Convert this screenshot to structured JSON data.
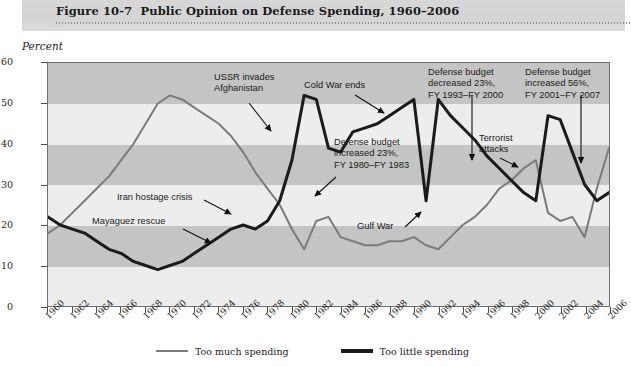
{
  "figure": {
    "number": "Figure 10-7",
    "title": "Public Opinion on Defense Spending, 1960–2006",
    "axis_note": "Percent"
  },
  "legend": {
    "items": [
      {
        "label": "Too much spending",
        "color": "#7b7b7b",
        "key": "too-much"
      },
      {
        "label": "Too little spending",
        "color": "#1b1b1b",
        "key": "too-little"
      }
    ]
  },
  "annotations": [
    {
      "key": "mayaguez",
      "text": "Mayaguez rescue"
    },
    {
      "key": "iran",
      "text": "Iran hostage crisis"
    },
    {
      "key": "ussr",
      "text": "USSR invades\nAfghanistan"
    },
    {
      "key": "budget-1980",
      "text": "Defense budget\nincreased 23%,\nFY 1980–FY 1983"
    },
    {
      "key": "cold-war",
      "text": "Cold War ends"
    },
    {
      "key": "gulf-war",
      "text": "Gulf War"
    },
    {
      "key": "budget-1993",
      "text": "Defense budget\ndecreased 23%,\nFY 1993–FY 2000"
    },
    {
      "key": "terrorist",
      "text": "Terrorist\nattacks"
    },
    {
      "key": "budget-2001",
      "text": "Defense budget\nincreased 56%,\nFY 2001–FY 2007"
    }
  ],
  "chart_data": {
    "type": "line",
    "title": "Public Opinion on Defense Spending, 1960–2006",
    "xlabel": "",
    "ylabel": "Percent",
    "ylim": [
      0,
      60
    ],
    "xlim": [
      1960,
      2006
    ],
    "yticks": [
      0,
      10,
      20,
      30,
      40,
      50,
      60
    ],
    "xticks": [
      1960,
      1962,
      1964,
      1966,
      1968,
      1970,
      1972,
      1974,
      1976,
      1978,
      1980,
      1982,
      1984,
      1986,
      1988,
      1990,
      1992,
      1994,
      1996,
      1998,
      2000,
      2002,
      2004,
      2006
    ],
    "grid": false,
    "legend_position": "bottom",
    "x": [
      1960,
      1961,
      1962,
      1963,
      1964,
      1965,
      1966,
      1967,
      1968,
      1969,
      1970,
      1971,
      1972,
      1973,
      1974,
      1975,
      1976,
      1977,
      1978,
      1979,
      1980,
      1981,
      1982,
      1983,
      1984,
      1985,
      1986,
      1987,
      1988,
      1989,
      1990,
      1991,
      1992,
      1993,
      1994,
      1995,
      1996,
      1997,
      1998,
      1999,
      2000,
      2001,
      2002,
      2003,
      2004,
      2005,
      2006
    ],
    "series": [
      {
        "name": "Too much spending",
        "color": "#7b7b7b",
        "values": [
          18,
          20,
          23,
          26,
          29,
          32,
          36,
          40,
          45,
          50,
          52,
          51,
          49,
          47,
          45,
          42,
          38,
          33,
          29,
          25,
          19,
          14,
          21,
          22,
          17,
          16,
          15,
          15,
          16,
          16,
          17,
          15,
          14,
          17,
          20,
          22,
          25,
          29,
          31,
          34,
          36,
          23,
          21,
          22,
          17,
          29,
          39
        ]
      },
      {
        "name": "Too little spending",
        "color": "#1b1b1b",
        "values": [
          22,
          20,
          19,
          18,
          16,
          14,
          13,
          11,
          10,
          9,
          10,
          11,
          13,
          15,
          17,
          19,
          20,
          19,
          21,
          26,
          36,
          52,
          51,
          39,
          38,
          43,
          44,
          45,
          47,
          49,
          51,
          26,
          51,
          47,
          44,
          41,
          37,
          34,
          31,
          28,
          26,
          47,
          46,
          38,
          30,
          26,
          28
        ]
      }
    ]
  }
}
